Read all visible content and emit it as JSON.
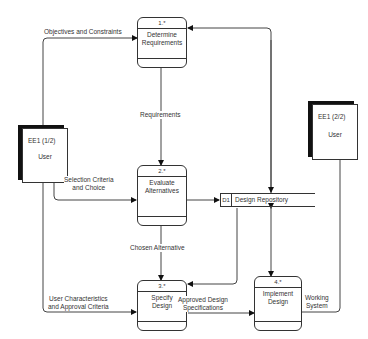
{
  "diagram": {
    "type": "data-flow-diagram",
    "processes": [
      {
        "id": "1.*",
        "name_line1": "Determine",
        "name_line2": "Requirements"
      },
      {
        "id": "2.*",
        "name_line1": "Evaluate",
        "name_line2": "Alternatives"
      },
      {
        "id": "3.*",
        "name_line1": "Specify",
        "name_line2": "Design"
      },
      {
        "id": "4.*",
        "name_line1": "Implement",
        "name_line2": "Design"
      }
    ],
    "entities": [
      {
        "id": "EE1  (1/2)",
        "name": "User"
      },
      {
        "id": "EE1  (2/2)",
        "name": "User"
      }
    ],
    "store": {
      "id": "D1",
      "name": "Design Repository"
    },
    "flows": {
      "objectives": "Objectives and Constraints",
      "requirements": "Requirements",
      "selection_line1": "Selection  Criteria",
      "selection_line2": "and Choice",
      "chosen": "Chosen  Alternative",
      "userchar_line1": "User  Characteristics",
      "userchar_line2": "and  Approval  Criteria",
      "approved_line1": "Approved Design",
      "approved_line2": "Specifications",
      "working_line1": "Working",
      "working_line2": "System"
    }
  }
}
